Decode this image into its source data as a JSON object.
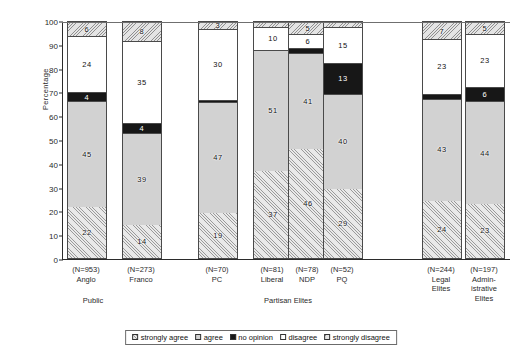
{
  "chart_data": {
    "type": "bar",
    "subtype": "stacked-percentage",
    "title": "",
    "xlabel": "",
    "ylabel": "Percentage",
    "ylim": [
      0,
      100
    ],
    "yticks": [
      0,
      10,
      20,
      30,
      40,
      50,
      60,
      70,
      80,
      90,
      100
    ],
    "grid": false,
    "legend_position": "bottom-center",
    "categories": [
      "Anglo",
      "Franco",
      "PC",
      "Liberal",
      "NDP",
      "PQ",
      "Legal Elites",
      "Administrative Elites"
    ],
    "category_n": [
      "(N=953)",
      "(N=273)",
      "(N=70)",
      "(N=81)",
      "(N=78)",
      "(N=52)",
      "(N=244)",
      "(N=197)"
    ],
    "groups": [
      {
        "label": "Public",
        "categories": [
          "Anglo",
          "Franco"
        ]
      },
      {
        "label": "Partisan Elites",
        "categories": [
          "PC",
          "Liberal",
          "NDP",
          "PQ"
        ]
      },
      {
        "label": "",
        "categories": [
          "Legal Elites",
          "Administrative Elites"
        ]
      }
    ],
    "series": [
      {
        "name": "strongly agree",
        "key": "sagree",
        "values": [
          22,
          14,
          19,
          37,
          46,
          29,
          24,
          23
        ]
      },
      {
        "name": "agree",
        "key": "agree",
        "values": [
          45,
          39,
          47,
          51,
          41,
          40,
          43,
          44
        ]
      },
      {
        "name": "no opinion",
        "key": "noop",
        "values": [
          4,
          4,
          1,
          0,
          2,
          13,
          2,
          6
        ]
      },
      {
        "name": "disagree",
        "key": "disagree",
        "values": [
          24,
          35,
          30,
          10,
          6,
          15,
          23,
          23
        ]
      },
      {
        "name": "strongly disagree",
        "key": "sdisagree",
        "values": [
          6,
          8,
          3,
          2,
          5,
          2,
          7,
          5
        ]
      }
    ],
    "legend": [
      {
        "label": "strongly agree",
        "key": "sagree"
      },
      {
        "label": "agree",
        "key": "agree"
      },
      {
        "label": "no opinion",
        "key": "noop"
      },
      {
        "label": "disagree",
        "key": "disagree"
      },
      {
        "label": "strongly disagree",
        "key": "sdisagree"
      }
    ]
  },
  "layout": {
    "bar_x": [
      66,
      121,
      197,
      252,
      287,
      322,
      421,
      464
    ],
    "bar_w": 40,
    "tick_x": [
      66,
      121,
      197,
      252,
      287,
      322,
      421,
      464
    ],
    "group_x": [
      93,
      288,
      442
    ]
  },
  "colors": {
    "axis": "#2b2b2b",
    "bar_border": "#4a4a4a",
    "agree_fill": "#d2d2d2",
    "no_opinion_fill": "#171717",
    "disagree_fill": "#ffffff",
    "hatch_fill": "#e9e9e9"
  }
}
